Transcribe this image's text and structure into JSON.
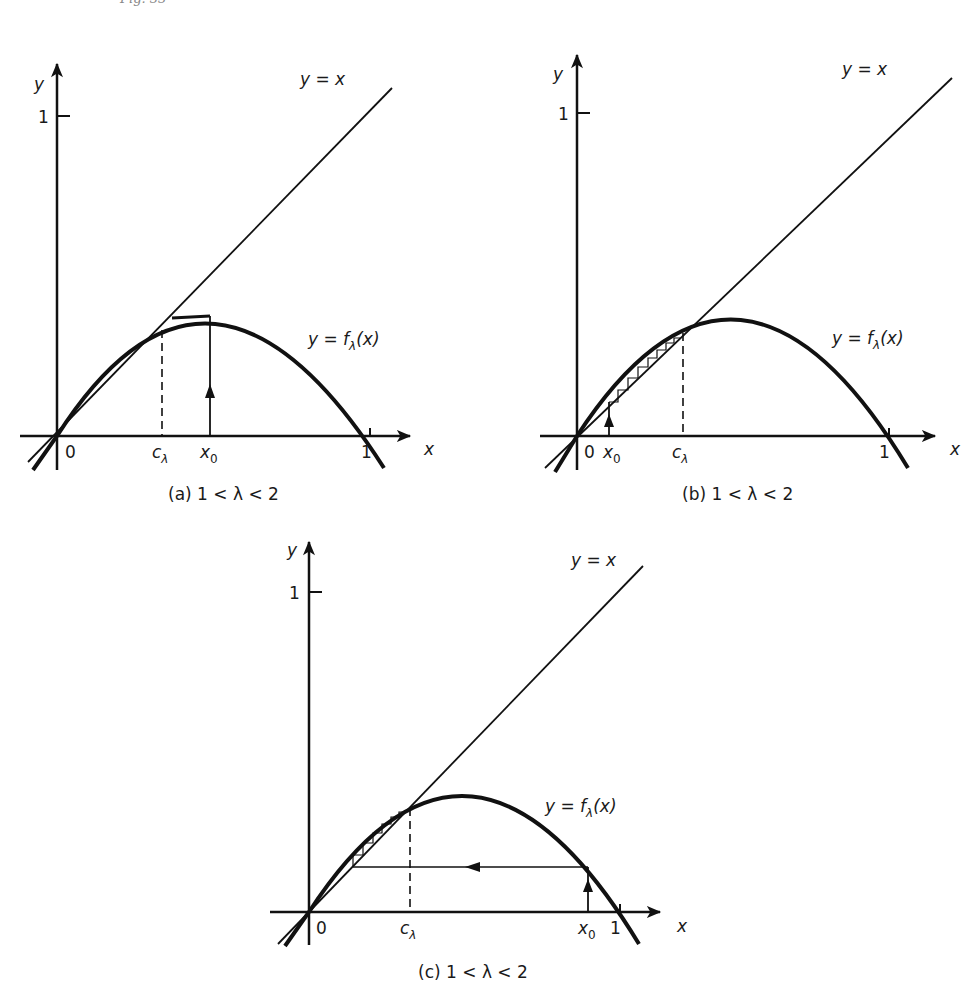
{
  "figure": {
    "header": "Fig. 33",
    "panels": [
      {
        "id": "a",
        "caption": "(a)  1 < λ < 2",
        "y_axis_label": "y",
        "x_axis_label": "x",
        "y_tick_label": "1",
        "origin_label": "0",
        "x_tick_one_label": "1",
        "c_label": "c",
        "c_sub": "λ",
        "x0_label": "x",
        "x0_sub": "0",
        "identity_label": "y = x",
        "curve_label_pre": "y = f",
        "curve_label_sub": "λ",
        "curve_label_post": "(x)",
        "x0_position": "right of c_λ",
        "orbit": "single vertical arrow from x0 up to curve, converges to fixed point c_λ"
      },
      {
        "id": "b",
        "caption": "(b)  1 < λ < 2",
        "y_axis_label": "y",
        "x_axis_label": "x",
        "y_tick_label": "1",
        "origin_label": "0",
        "x_tick_one_label": "1",
        "c_label": "c",
        "c_sub": "λ",
        "x0_label": "x",
        "x0_sub": "0",
        "identity_label": "y = x",
        "curve_label_pre": "y = f",
        "curve_label_sub": "λ",
        "curve_label_post": "(x)",
        "x0_position": "between 0 and c_λ",
        "orbit": "staircase cobweb between curve and y=x increasing to c_λ"
      },
      {
        "id": "c",
        "caption": "(c)  1 < λ < 2",
        "y_axis_label": "y",
        "x_axis_label": "x",
        "y_tick_label": "1",
        "origin_label": "0",
        "x_tick_one_label": "1",
        "c_label": "c",
        "c_sub": "λ",
        "x0_label": "x",
        "x0_sub": "0",
        "identity_label": "y = x",
        "curve_label_pre": "y = f",
        "curve_label_sub": "λ",
        "curve_label_post": "(x)",
        "x0_position": "near 1",
        "orbit": "up to curve, left to y=x, then staircase up to c_λ"
      }
    ]
  }
}
